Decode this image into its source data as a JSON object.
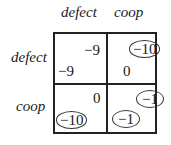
{
  "matrix": {
    "col_headers": [
      "defect",
      "coop"
    ],
    "row_headers": [
      "defect",
      "coop"
    ],
    "cells": [
      [
        {
          "top_right": "−9",
          "top_right_circled": false,
          "bottom_left": "−9",
          "bottom_left_circled": false
        },
        {
          "top_right": "−10",
          "top_right_circled": true,
          "bottom_left": "0",
          "bottom_left_circled": false
        }
      ],
      [
        {
          "top_right": "0",
          "top_right_circled": false,
          "bottom_left": "−10",
          "bottom_left_circled": true
        },
        {
          "top_right": "−1",
          "top_right_circled": true,
          "bottom_left": "−1",
          "bottom_left_circled": true
        }
      ]
    ]
  }
}
